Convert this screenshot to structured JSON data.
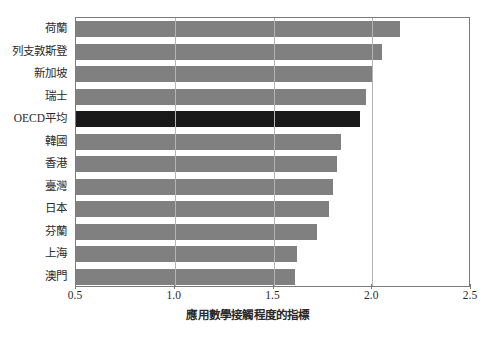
{
  "chart_data": {
    "type": "bar",
    "orientation": "horizontal",
    "title": "",
    "subtitle": "",
    "xlabel": "應用數學接觸程度的指標",
    "ylabel": "",
    "xlim": [
      0.5,
      2.5
    ],
    "ylim": null,
    "grid": true,
    "legend": null,
    "xticks": [
      "0.5",
      "1.0",
      "1.5",
      "2.0",
      "2.5"
    ],
    "xtick_values": [
      0.5,
      1.0,
      1.5,
      2.0,
      2.5
    ],
    "gridline_values": [
      1.0,
      1.5,
      2.0
    ],
    "categories": [
      "荷蘭",
      "列支敦斯登",
      "新加坡",
      "瑞士",
      "OECD平均",
      "韓國",
      "香港",
      "臺灣",
      "日本",
      "芬蘭",
      "上海",
      "澳門"
    ],
    "values": [
      2.14,
      2.05,
      2.0,
      1.97,
      1.94,
      1.84,
      1.82,
      1.8,
      1.78,
      1.72,
      1.62,
      1.61
    ],
    "highlight_category": "OECD平均",
    "bar_color": "#808080",
    "highlight_color": "#1a1a1a",
    "axis_color": "#7a7a7a",
    "grid_color": "#b4b4b4"
  }
}
